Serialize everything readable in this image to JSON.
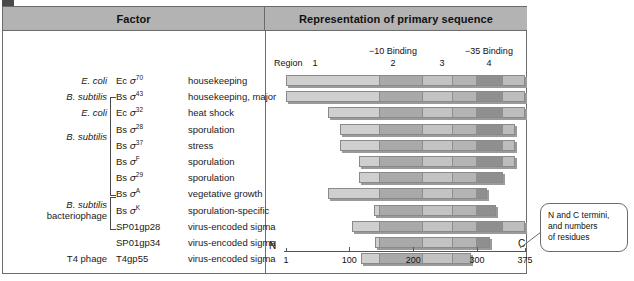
{
  "figure": {
    "tag": "b"
  },
  "headers": {
    "left": "Factor",
    "right": "Representation of primary sequence"
  },
  "rows": [
    {
      "organism": "E. coli",
      "italic": true,
      "name_prefix": "Ec",
      "name_sigma": "σ",
      "name_sup": "70",
      "function": "housekeeping"
    },
    {
      "organism": "B. subtilis",
      "italic": true,
      "name_prefix": "Bs",
      "name_sigma": "σ",
      "name_sup": "43",
      "function": "housekeeping, major"
    },
    {
      "organism": "E. coli",
      "italic": true,
      "name_prefix": "Ec",
      "name_sigma": "σ",
      "name_sup": "32",
      "function": "heat shock"
    },
    {
      "organism": "",
      "italic": true,
      "name_prefix": "Bs",
      "name_sigma": "σ",
      "name_sup": "28",
      "function": "sporulation"
    },
    {
      "organism": "",
      "italic": true,
      "name_prefix": "Bs",
      "name_sigma": "σ",
      "name_sup": "37",
      "function": "stress"
    },
    {
      "organism": "",
      "italic": true,
      "name_prefix": "Bs",
      "name_sigma": "σ",
      "name_sup": "F",
      "function": "sporulation"
    },
    {
      "organism": "",
      "italic": true,
      "name_prefix": "Bs",
      "name_sigma": "σ",
      "name_sup": "29",
      "function": "sporulation"
    },
    {
      "organism": "",
      "italic": true,
      "name_prefix": "Bs",
      "name_sigma": "σ",
      "name_sup": "A",
      "function": "vegetative growth"
    },
    {
      "organism": "",
      "italic": true,
      "name_prefix": "Bs",
      "name_sigma": "σ",
      "name_sup": "K",
      "function": "sporulation-specific"
    },
    {
      "organism": "",
      "italic": false,
      "name_prefix": "SP01gp28",
      "name_sigma": "",
      "name_sup": "",
      "function": "virus-encoded sigma"
    },
    {
      "organism": "",
      "italic": false,
      "name_prefix": "SP01gp34",
      "name_sigma": "",
      "name_sup": "",
      "function": "virus-encoded sigma"
    },
    {
      "organism": "T4 phage",
      "italic": false,
      "name_prefix": "T4gp55",
      "name_sigma": "",
      "name_sup": "",
      "function": "virus-encoded sigma"
    }
  ],
  "group_labels": {
    "b_subtilis": "B. subtilis",
    "phage_line1": "B. subtilis",
    "phage_line2": "bacteriophage"
  },
  "diagram": {
    "region_word": "Region",
    "region_numbers": [
      "1",
      "2",
      "3",
      "4"
    ],
    "binding_labels": [
      "−10 Binding",
      "−35 Binding"
    ],
    "terminus_n": "N",
    "terminus_c": "C",
    "axis_ticks": [
      "1",
      "100",
      "200",
      "300",
      "375"
    ]
  },
  "chart_data": {
    "type": "bar",
    "title": "Representation of primary sequence",
    "xlabel": "residue number",
    "xlim": [
      1,
      375
    ],
    "grid": false,
    "legend": "none",
    "note": "Each horizontal bar is one sigma factor drawn to scale along the residue axis; segments are conserved regions 1-4.",
    "categories": [
      "Ec σ70",
      "Bs σ43",
      "Ec σ32",
      "Bs σ28",
      "Bs σ37",
      "Bs σF",
      "Bs σ29",
      "Bs σA",
      "Bs σK",
      "SP01gp28",
      "SP01gp34",
      "T4gp55"
    ],
    "series": [
      {
        "name": "start_residue",
        "values": [
          1,
          1,
          66,
          85,
          85,
          116,
          116,
          66,
          138,
          105,
          140,
          118
        ]
      },
      {
        "name": "end_residue",
        "values": [
          375,
          375,
          375,
          360,
          360,
          360,
          340,
          315,
          330,
          375,
          320,
          290
        ]
      },
      {
        "name": "length",
        "values": [
          375,
          375,
          310,
          275,
          275,
          245,
          225,
          250,
          193,
          270,
          180,
          172
        ]
      }
    ],
    "region_boundaries_residues": [
      1,
      148,
      216,
      262,
      300,
      340,
      375
    ]
  },
  "callout": {
    "line1": "N and C termini,",
    "line2": "and numbers",
    "line3": "of residues"
  }
}
